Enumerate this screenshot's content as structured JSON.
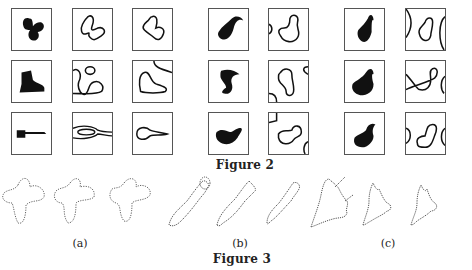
{
  "figure2": {
    "caption": "Figure 2",
    "groups": [
      {
        "name": "shapes-a",
        "rows": [
          "butterfly",
          "boot",
          "guitar"
        ]
      },
      {
        "name": "shapes-b",
        "rows": [
          "swan-shape-1",
          "swan-shape-2",
          "swan-shape-3"
        ]
      },
      {
        "name": "shapes-c",
        "rows": [
          "swan-shape-4",
          "swan-shape-5",
          "swan-shape-6"
        ]
      }
    ]
  },
  "figure3": {
    "caption": "Figure 3",
    "panels": [
      {
        "label": "(a)",
        "subject": "butterfly-contours"
      },
      {
        "label": "(b)",
        "subject": "fish-contours"
      },
      {
        "label": "(c)",
        "subject": "jagged-shape-contours"
      }
    ]
  },
  "colors": {
    "ink": "#111111",
    "frame": "#555555",
    "dotted": "#666666"
  }
}
